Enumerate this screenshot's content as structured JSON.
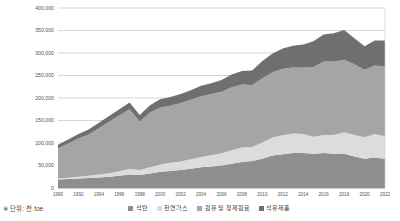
{
  "footnote": "※ 단위: 천 toe",
  "colors": {
    "coal": "#8e8e8e",
    "gas": "#dcdcdc",
    "crude": "#a5a5a5",
    "petroleum": "#6f6f6f",
    "grid": "#b9b9b9",
    "axis": "#8c8c8c",
    "text": "#545454"
  },
  "legend": {
    "items": [
      {
        "label": "석탄",
        "color": "#8e8e8e"
      },
      {
        "label": "천연가스",
        "color": "#dcdcdc"
      },
      {
        "label": "원유 및 정제원료",
        "color": "#a5a5a5"
      },
      {
        "label": "석유제품",
        "color": "#6f6f6f"
      }
    ]
  },
  "chart_data": {
    "type": "area",
    "stacked": true,
    "title": "",
    "xlabel": "",
    "ylabel": "",
    "unit": "천 toe",
    "grid": true,
    "legend_position": "bottom",
    "ylim": [
      0,
      400000
    ],
    "yticks": [
      0,
      50000,
      100000,
      150000,
      200000,
      250000,
      300000,
      350000,
      400000
    ],
    "ytick_labels": [
      "0",
      "50,000",
      "100,000",
      "150,000",
      "200,000",
      "250,000",
      "300,000",
      "350,000",
      "400,000"
    ],
    "xlim": [
      1990,
      2022
    ],
    "xticks": [
      1990,
      1992,
      1994,
      1996,
      1998,
      2000,
      2002,
      2004,
      2006,
      2008,
      2010,
      2012,
      2014,
      2016,
      2018,
      2020,
      2022
    ],
    "xtick_labels": [
      "1990",
      "1992",
      "1994",
      "1996",
      "1998",
      "2000",
      "2002",
      "2004",
      "2006",
      "2008",
      "2010",
      "2012",
      "2014",
      "2016",
      "2018",
      "2020",
      "2022"
    ],
    "x": [
      1990,
      1991,
      1992,
      1993,
      1994,
      1995,
      1996,
      1997,
      1998,
      1999,
      2000,
      2001,
      2002,
      2003,
      2004,
      2005,
      2006,
      2007,
      2008,
      2009,
      2010,
      2011,
      2012,
      2013,
      2014,
      2015,
      2016,
      2017,
      2018,
      2019,
      2020,
      2021,
      2022
    ],
    "series": [
      {
        "name": "석탄",
        "color": "#8e8e8e",
        "values": [
          19000,
          20000,
          21000,
          22000,
          23500,
          25000,
          27000,
          30000,
          29000,
          32000,
          36000,
          38000,
          40000,
          43000,
          46000,
          48000,
          50000,
          54000,
          58000,
          60000,
          65000,
          72000,
          75000,
          78000,
          78000,
          76000,
          78000,
          76000,
          76000,
          70000,
          65000,
          68000,
          65000
        ]
      },
      {
        "name": "천연가스",
        "color": "#dcdcdc",
        "values": [
          2000,
          3000,
          4000,
          5000,
          6500,
          8000,
          10000,
          12000,
          11000,
          14000,
          16000,
          18000,
          19000,
          21000,
          23000,
          25000,
          27000,
          30000,
          32000,
          31000,
          36000,
          40000,
          42000,
          43000,
          42000,
          38000,
          40000,
          42000,
          48000,
          48000,
          48000,
          52000,
          50000
        ]
      },
      {
        "name": "원유 및 정제원료",
        "color": "#a5a5a5",
        "values": [
          67000,
          76000,
          85000,
          92000,
          103000,
          114000,
          124000,
          133000,
          108000,
          122000,
          127000,
          127000,
          130000,
          132000,
          135000,
          136000,
          137000,
          140000,
          140000,
          138000,
          143000,
          145000,
          148000,
          147000,
          147000,
          155000,
          163000,
          163000,
          161000,
          157000,
          150000,
          152000,
          155000
        ]
      },
      {
        "name": "석유제품",
        "color": "#6f6f6f",
        "values": [
          8000,
          9000,
          10000,
          11000,
          12000,
          13000,
          14000,
          15000,
          14000,
          16000,
          18000,
          19000,
          20000,
          21000,
          23000,
          24000,
          26000,
          28000,
          30000,
          32000,
          38000,
          42000,
          45000,
          48000,
          52000,
          57000,
          60000,
          63000,
          66000,
          58000,
          52000,
          56000,
          58000
        ]
      }
    ],
    "totals": [
      96000,
      108000,
      120000,
      130000,
      145000,
      160000,
      175000,
      190000,
      162000,
      184000,
      197000,
      202000,
      209000,
      217000,
      227000,
      233000,
      240000,
      252000,
      260000,
      261000,
      282000,
      299000,
      310000,
      316000,
      319000,
      326000,
      341000,
      344000,
      351000,
      333000,
      315000,
      328000,
      328000
    ]
  }
}
